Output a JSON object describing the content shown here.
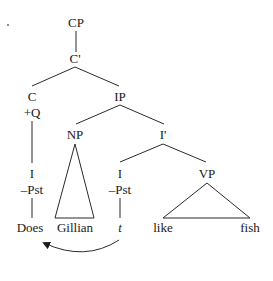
{
  "diagram": {
    "type": "syntax-tree",
    "nodes": {
      "cp": "CP",
      "c_bar": "C'",
      "c": "C",
      "c_feature": "+Q",
      "ip": "IP",
      "np": "NP",
      "i_bar": "I'",
      "i_moved": "I",
      "i_moved_feature": "–Pst",
      "i_trace_head": "I",
      "i_trace_feature": "–Pst",
      "vp": "VP"
    },
    "leaves": {
      "does": "Does",
      "gillian": "Gillian",
      "trace": "t",
      "like": "like",
      "fish": "fish"
    },
    "movement": {
      "from": "t",
      "to": "Does",
      "description": "I-to-C head movement arrow"
    },
    "colors": {
      "ink": "#1a1a1a",
      "background": "#ffffff"
    }
  }
}
